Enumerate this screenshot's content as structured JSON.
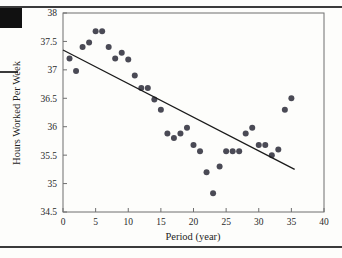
{
  "page": {
    "corner_block": "black-square-marker",
    "rules": [
      "top-rule",
      "bottom-rule",
      "left-dash"
    ]
  },
  "chart_data": {
    "type": "scatter",
    "title": "",
    "xlabel": "Period (year)",
    "ylabel": "Hours Worked Per Week",
    "xlim": [
      0,
      40
    ],
    "ylim": [
      34.5,
      38
    ],
    "xticks": [
      0,
      5,
      10,
      15,
      20,
      25,
      30,
      35,
      40
    ],
    "xtick_labels": [
      "0",
      "5",
      "10",
      "15",
      "20",
      "25",
      "30",
      "35",
      "40"
    ],
    "yticks": [
      34.5,
      35,
      35.5,
      36,
      36.5,
      37,
      37.5,
      38
    ],
    "ytick_labels": [
      "34.5",
      "35",
      "35.5",
      "36",
      "36.5",
      "37",
      "37.5",
      "38"
    ],
    "grid": false,
    "legend": null,
    "marker_color": "#4a4a55",
    "marker_size": 3,
    "line_color": "#1a1a1a",
    "series": [
      {
        "name": "Hours worked per week",
        "type": "scatter",
        "x": [
          1,
          2,
          3,
          4,
          5,
          6,
          7,
          8,
          9,
          10,
          11,
          12,
          13,
          14,
          15,
          16,
          17,
          18,
          19,
          20,
          21,
          22,
          23,
          24,
          25,
          26,
          27,
          28,
          29,
          30,
          31,
          32,
          33,
          34,
          35
        ],
        "y": [
          37.2,
          36.98,
          37.4,
          37.48,
          37.68,
          37.68,
          37.4,
          37.2,
          37.3,
          37.18,
          36.9,
          36.68,
          36.68,
          36.48,
          36.3,
          35.88,
          35.8,
          35.88,
          35.98,
          35.68,
          35.57,
          35.2,
          34.83,
          35.3,
          35.57,
          35.57,
          35.57,
          35.88,
          35.98,
          35.68,
          35.68,
          35.5,
          35.6,
          36.3,
          36.5
        ]
      },
      {
        "name": "Fitted regression line",
        "type": "line",
        "x": [
          0,
          35.5
        ],
        "y": [
          37.35,
          35.25
        ]
      }
    ]
  }
}
